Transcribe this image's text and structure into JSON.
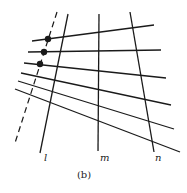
{
  "figure": {
    "caption": "(b)",
    "stroke_color": "#1a1a1a",
    "background": "#ffffff"
  },
  "transversals": [
    {
      "id": "l",
      "label": "l",
      "x1": 68,
      "y1": 14,
      "x2": 40,
      "y2": 153,
      "label_x": 44,
      "label_y": 161
    },
    {
      "id": "m",
      "label": "m",
      "x1": 99,
      "y1": 14,
      "x2": 98,
      "y2": 151,
      "label_x": 100,
      "label_y": 161
    },
    {
      "id": "n",
      "label": "n",
      "x1": 130,
      "y1": 12,
      "x2": 154,
      "y2": 152,
      "label_x": 155,
      "label_y": 161
    }
  ],
  "dashed_line": {
    "x1": 57,
    "y1": 12,
    "x2": 15,
    "y2": 143
  },
  "crossing_lines": [
    {
      "x1": 32,
      "y1": 41,
      "x2": 154,
      "y2": 25
    },
    {
      "x1": 28,
      "y1": 52,
      "x2": 161,
      "y2": 50
    },
    {
      "x1": 24,
      "y1": 63,
      "x2": 166,
      "y2": 78
    },
    {
      "x1": 21,
      "y1": 73,
      "x2": 171,
      "y2": 105
    },
    {
      "x1": 18,
      "y1": 81,
      "x2": 174,
      "y2": 129
    },
    {
      "x1": 15,
      "y1": 89,
      "x2": 180,
      "y2": 152
    }
  ],
  "points": [
    {
      "cx": 48,
      "cy": 39
    },
    {
      "cx": 44,
      "cy": 52
    },
    {
      "cx": 40,
      "cy": 64
    }
  ],
  "caption_pos": {
    "x": 84,
    "y": 178
  }
}
